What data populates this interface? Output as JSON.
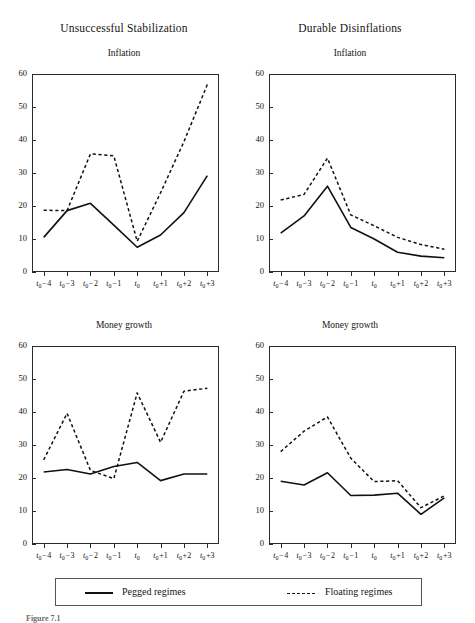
{
  "figure": {
    "column_titles": [
      "Unsuccessful Stabilization",
      "Durable Disinflations"
    ],
    "caption": "Figure 7.1"
  },
  "legend": {
    "pegged_label": "Pegged regimes",
    "floating_label": "Floating regimes",
    "pegged_style": "solid",
    "floating_style": "dashed",
    "line_color": "#111111"
  },
  "axis": {
    "x_categories": [
      "t0-4",
      "t0-3",
      "t0-2",
      "t0-1",
      "t0",
      "t0+1",
      "t0+2",
      "t0+3"
    ],
    "x_tick_labels": [
      {
        "base": "t",
        "sub": "0",
        "suffix": " − 4"
      },
      {
        "base": "t",
        "sub": "0",
        "suffix": " − 3"
      },
      {
        "base": "t",
        "sub": "0",
        "suffix": " − 2"
      },
      {
        "base": "t",
        "sub": "0",
        "suffix": " − 1"
      },
      {
        "base": "t",
        "sub": "0",
        "suffix": ""
      },
      {
        "base": "t",
        "sub": "0",
        "suffix": " +1"
      },
      {
        "base": "t",
        "sub": "0",
        "suffix": " +2"
      },
      {
        "base": "t",
        "sub": "0",
        "suffix": " +3"
      }
    ],
    "y_ticks": [
      0,
      10,
      20,
      30,
      40,
      50,
      60
    ],
    "ylim": [
      0,
      60
    ],
    "grid": false
  },
  "chart_data": [
    {
      "id": "unsuccessful-inflation",
      "type": "line",
      "title": "Inflation",
      "column": "Unsuccessful Stabilization",
      "xlabel": "",
      "ylabel": "",
      "ylim": [
        0,
        60
      ],
      "categories": [
        "t0-4",
        "t0-3",
        "t0-2",
        "t0-1",
        "t0",
        "t0+1",
        "t0+2",
        "t0+3"
      ],
      "series": [
        {
          "name": "Pegged regimes",
          "style": "solid",
          "values": [
            10.5,
            18.6,
            20.8,
            14.2,
            7.5,
            11.2,
            18.0,
            29.2
          ]
        },
        {
          "name": "Floating regimes",
          "style": "dashed",
          "values": [
            18.7,
            18.6,
            35.8,
            35.2,
            9.3,
            24.0,
            39.5,
            56.8
          ]
        }
      ]
    },
    {
      "id": "durable-inflation",
      "type": "line",
      "title": "Inflation",
      "column": "Durable Disinflations",
      "xlabel": "",
      "ylabel": "",
      "ylim": [
        0,
        60
      ],
      "categories": [
        "t0-4",
        "t0-3",
        "t0-2",
        "t0-1",
        "t0",
        "t0+1",
        "t0+2",
        "t0+3"
      ],
      "series": [
        {
          "name": "Pegged regimes",
          "style": "solid",
          "values": [
            11.8,
            17.0,
            26.0,
            13.5,
            10.0,
            6.0,
            4.8,
            4.3
          ]
        },
        {
          "name": "Floating regimes",
          "style": "dashed",
          "values": [
            21.8,
            23.5,
            34.5,
            17.3,
            14.0,
            10.5,
            8.3,
            6.9
          ]
        }
      ]
    },
    {
      "id": "unsuccessful-money-growth",
      "type": "line",
      "title": "Money growth",
      "column": "Unsuccessful Stabilization",
      "xlabel": "",
      "ylabel": "",
      "ylim": [
        0,
        60
      ],
      "categories": [
        "t0-4",
        "t0-3",
        "t0-2",
        "t0-1",
        "t0",
        "t0+1",
        "t0+2",
        "t0+3"
      ],
      "series": [
        {
          "name": "Pegged regimes",
          "style": "solid",
          "values": [
            21.8,
            22.6,
            21.2,
            23.5,
            24.7,
            19.2,
            21.2,
            21.2
          ]
        },
        {
          "name": "Floating regimes",
          "style": "dashed",
          "values": [
            25.5,
            39.6,
            22.3,
            19.8,
            45.8,
            30.8,
            46.3,
            47.2
          ]
        }
      ]
    },
    {
      "id": "durable-money-growth",
      "type": "line",
      "title": "Money growth",
      "column": "Durable Disinflations",
      "xlabel": "",
      "ylabel": "",
      "ylim": [
        0,
        60
      ],
      "categories": [
        "t0-4",
        "t0-3",
        "t0-2",
        "t0-1",
        "t0",
        "t0+1",
        "t0+2",
        "t0+3"
      ],
      "series": [
        {
          "name": "Pegged regimes",
          "style": "solid",
          "values": [
            19.0,
            17.9,
            21.6,
            14.7,
            14.8,
            15.4,
            9.0,
            14.0
          ]
        },
        {
          "name": "Floating regimes",
          "style": "dashed",
          "values": [
            28.0,
            34.2,
            38.5,
            26.0,
            18.9,
            19.2,
            11.0,
            14.6
          ]
        }
      ]
    }
  ]
}
